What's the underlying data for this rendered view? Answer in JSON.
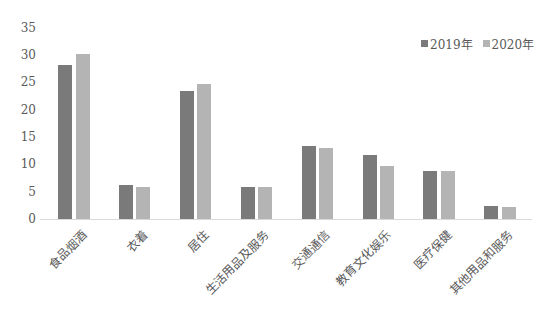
{
  "chart_data": {
    "type": "bar",
    "title": "",
    "xlabel": "",
    "ylabel": "",
    "ylim": [
      0,
      35
    ],
    "yticks": [
      0,
      5,
      10,
      15,
      20,
      25,
      30,
      35
    ],
    "grid": false,
    "legend_position": "top-right",
    "categories": [
      "食品烟酒",
      "衣着",
      "居住",
      "生活用品及服务",
      "交通通信",
      "教育文化娱乐",
      "医疗保健",
      "其他用品和服务"
    ],
    "series": [
      {
        "name": "2019年",
        "color": "#7a7a7a",
        "values": [
          28.2,
          6.2,
          23.4,
          5.9,
          13.3,
          11.7,
          8.8,
          2.4
        ]
      },
      {
        "name": "2020年",
        "color": "#b4b4b4",
        "values": [
          30.2,
          5.8,
          24.6,
          5.9,
          13.0,
          9.6,
          8.7,
          2.2
        ]
      }
    ]
  }
}
